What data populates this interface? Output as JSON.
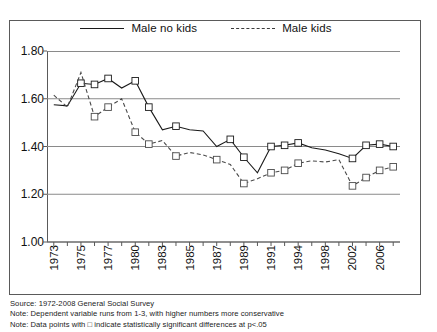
{
  "figure": {
    "legend": [
      {
        "label": "Male no kids",
        "style": "solid"
      },
      {
        "label": "Male kids",
        "style": "dashed"
      }
    ],
    "footnotes": [
      "Source: 1972-2008 General Social Survey",
      "Note: Dependent variable runs from 1-3, with higher numbers more conservative",
      "Note: Data points with □ indicate statistically significant differences at p<.05"
    ]
  },
  "chart_data": {
    "type": "line",
    "title": "",
    "xlabel": "",
    "ylabel": "",
    "ylim": [
      1.0,
      1.8
    ],
    "yticks": [
      "1.00",
      "1.20",
      "1.40",
      "1.60",
      "1.80"
    ],
    "ytick_values": [
      1.0,
      1.2,
      1.4,
      1.6,
      1.8
    ],
    "grid": true,
    "legend_position": "top-center",
    "x": [
      1973,
      1974,
      1975,
      1976,
      1977,
      1978,
      1980,
      1982,
      1983,
      1984,
      1985,
      1986,
      1987,
      1988,
      1989,
      1990,
      1991,
      1993,
      1994,
      1996,
      1998,
      2000,
      2002,
      2004,
      2006,
      2008
    ],
    "xtick_labels": [
      "1973",
      "",
      "1975",
      "",
      "1977",
      "",
      "1980",
      "",
      "1983",
      "",
      "1985",
      "",
      "1987",
      "",
      "1989",
      "",
      "1991",
      "",
      "1994",
      "",
      "1998",
      "",
      "2002",
      "",
      "2006",
      ""
    ],
    "xtick_labels_shown": [
      "1973",
      "1975",
      "1977",
      "1980",
      "1983",
      "1985",
      "1987",
      "1989",
      "1991",
      "1994",
      "1998",
      "2002",
      "2006"
    ],
    "series": [
      {
        "name": "Male no kids",
        "style": "solid",
        "values": [
          1.575,
          1.57,
          1.665,
          1.66,
          1.685,
          1.645,
          1.675,
          1.565,
          1.47,
          1.485,
          1.47,
          1.465,
          1.4,
          1.43,
          1.355,
          1.29,
          1.4,
          1.405,
          1.415,
          1.395,
          1.385,
          1.37,
          1.35,
          1.405,
          1.41,
          1.4
        ],
        "markers": [
          false,
          false,
          true,
          true,
          true,
          false,
          true,
          true,
          false,
          true,
          false,
          false,
          false,
          true,
          true,
          false,
          true,
          true,
          true,
          false,
          false,
          false,
          true,
          true,
          true,
          true
        ]
      },
      {
        "name": "Male kids",
        "style": "dashed",
        "values": [
          1.615,
          1.565,
          1.71,
          1.525,
          1.565,
          1.6,
          1.46,
          1.41,
          1.425,
          1.36,
          1.375,
          1.365,
          1.345,
          1.325,
          1.245,
          1.265,
          1.29,
          1.3,
          1.33,
          1.34,
          1.335,
          1.345,
          1.235,
          1.27,
          1.3,
          1.315
        ],
        "markers": [
          false,
          false,
          false,
          true,
          true,
          false,
          true,
          true,
          false,
          true,
          false,
          false,
          true,
          false,
          true,
          false,
          true,
          true,
          true,
          false,
          false,
          false,
          true,
          true,
          true,
          true
        ]
      }
    ]
  }
}
